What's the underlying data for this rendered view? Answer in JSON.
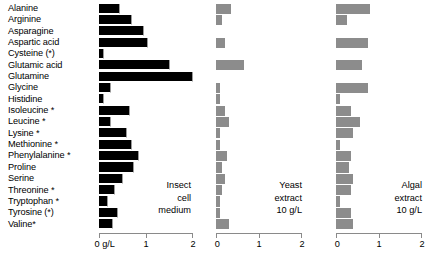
{
  "chart_data": {
    "type": "bar",
    "title": "",
    "orientation": "horizontal",
    "xlabel": "g/L",
    "ylabel": "",
    "xlim": [
      0,
      2
    ],
    "xticks": [
      0,
      1,
      2
    ],
    "xtick_labels_first_panel": [
      "0 g/L",
      "1",
      "2"
    ],
    "xtick_labels": [
      "0",
      "1",
      "2"
    ],
    "grid": false,
    "legend": "none",
    "categories": [
      "Alanine",
      "Arginine",
      "Asparagine",
      "Aspartic acid",
      "Cysteine (*)",
      "Glutamic acid",
      "Glutamine",
      "Glycine",
      "Histidine",
      "Isoleucine *",
      "Leucine  *",
      "Lysine *",
      "Methionine *",
      "Phenylalanine *",
      "Proline",
      "Serine",
      "Threonine *",
      "Tryptophan *",
      "Tyrosine (*)",
      "Valine*"
    ],
    "series": [
      {
        "name": "Insect cell medium",
        "caption_lines": [
          "Insect",
          "cell",
          "medium"
        ],
        "color": "#000000",
        "values": [
          0.45,
          0.7,
          0.95,
          1.05,
          0.1,
          1.5,
          2.0,
          0.25,
          0.1,
          0.65,
          0.25,
          0.6,
          0.7,
          0.85,
          0.75,
          0.5,
          0.35,
          0.2,
          0.4,
          0.3
        ]
      },
      {
        "name": "Yeast extract 10 g/L",
        "caption_lines": [
          "Yeast",
          "extract",
          "10 g/L"
        ],
        "color": "#8c8c8c",
        "values": [
          0.35,
          0.15,
          0.0,
          0.2,
          0.0,
          0.65,
          0.0,
          0.1,
          0.1,
          0.2,
          0.3,
          0.1,
          0.1,
          0.25,
          0.15,
          0.2,
          0.15,
          0.1,
          0.1,
          0.3
        ]
      },
      {
        "name": "Algal extract 10 g/L",
        "caption_lines": [
          "Algal",
          "extract",
          "10 g/L"
        ],
        "color": "#8c8c8c",
        "values": [
          0.8,
          0.25,
          0.0,
          0.75,
          0.0,
          0.6,
          0.0,
          0.75,
          0.1,
          0.35,
          0.55,
          0.4,
          0.1,
          0.35,
          0.3,
          0.4,
          0.35,
          0.1,
          0.35,
          0.4
        ]
      }
    ]
  }
}
